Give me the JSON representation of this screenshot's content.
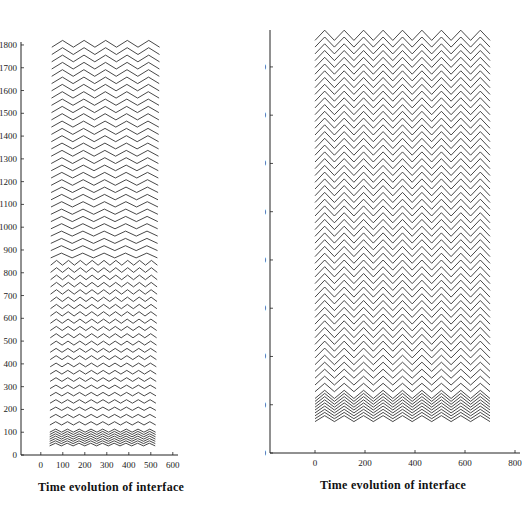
{
  "chart_data": [
    {
      "type": "line",
      "title": "",
      "caption": "Time evolution of interface",
      "xlabel": "",
      "ylabel": "",
      "xlim": [
        -90,
        600
      ],
      "ylim": [
        0,
        1800
      ],
      "x_ticks": [
        0,
        100,
        200,
        300,
        400,
        500,
        600
      ],
      "y_ticks": [
        0,
        100,
        200,
        300,
        400,
        500,
        600,
        700,
        800,
        900,
        1000,
        1100,
        1200,
        1300,
        1400,
        1500,
        1600,
        1700,
        1800
      ],
      "y_tick_labels": [
        "0",
        "100",
        "200",
        "300",
        "400",
        "500",
        "600",
        "700",
        "800",
        "900",
        "1000",
        "1100",
        "1200",
        "1300",
        "1400",
        "1500",
        "1600",
        "1700",
        "1800"
      ],
      "grid": false,
      "legend": null,
      "description": "Stacked interface profiles (waterfall), each curve offset vertically by time step; lower curves show ~9 short-wavelength oscillations, upper curves coarsen to 5 triangular peaks.",
      "series": {
        "curve_count": 60,
        "baseline_start": 40,
        "baseline_step": 29,
        "x_start_bottom": 40,
        "x_end_bottom": 520,
        "x_start_top": 50,
        "x_end_top": 540,
        "cycles_bottom": 9,
        "cycles_top": 5,
        "amplitude_bottom": 12,
        "amplitude_top": 30
      }
    },
    {
      "type": "line",
      "title": "",
      "caption": "Time evolution of interface",
      "xlabel": "",
      "ylabel": "",
      "xlim": [
        -180,
        820
      ],
      "ylim": [
        -100,
        1640
      ],
      "x_ticks": [
        0,
        200,
        400,
        600,
        800
      ],
      "y_ticks": [
        -100,
        100,
        300,
        500,
        700,
        900,
        1100,
        1300,
        1500
      ],
      "y_tick_labels": [
        "−100",
        "100",
        "300",
        "500",
        "700",
        "900",
        "1100",
        "1300",
        "1500"
      ],
      "grid": false,
      "legend": null,
      "description": "Stacked interface profiles, each curve a triangular zigzag with ~9 peaks spanning x 0-700, offset vertically; spacing tightens near the bottom.",
      "series": {
        "curve_count": 62,
        "baseline_start": 30,
        "baseline_step": 26,
        "x_start": 0,
        "x_end": 700,
        "cycles": 9,
        "amplitude_bottom": 25,
        "amplitude_top": 42
      }
    }
  ],
  "captions": {
    "left": "Time evolution of interface",
    "right": "Time evolution of interface"
  }
}
